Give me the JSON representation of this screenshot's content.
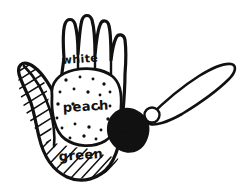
{
  "artwork": {
    "title": "Hand colour-zone sketch with paintbrush",
    "medium": "black ink line drawing",
    "background_color": "#ffffff",
    "ink_color": "#111111"
  },
  "hand": {
    "name": "open hand, palm facing viewer",
    "zones": [
      {
        "id": "fingers",
        "label": "white",
        "fill": "#ffffff",
        "texture": "plain",
        "label_x": 62,
        "label_y": 64,
        "label_size": 11,
        "label_rotation": -4
      },
      {
        "id": "palm",
        "label": "peach",
        "fill": "#ffffff",
        "texture": "dots",
        "label_x": 63,
        "label_y": 112,
        "label_size": 13,
        "label_rotation": -3
      },
      {
        "id": "heel",
        "label": "green",
        "fill": "#ffffff",
        "texture": "diagonal-hatch",
        "label_x": 59,
        "label_y": 161,
        "label_size": 13,
        "label_rotation": -4
      }
    ],
    "thumb": {
      "id": "thumb",
      "texture": "diagonal-hatch"
    },
    "fingers_count": 4
  },
  "brush": {
    "name": "paintbrush",
    "handle_direction": "up-right",
    "bristle_fill": "#111111",
    "ferrule_fill": "#ffffff"
  },
  "palm_dots": [
    [
      66,
      80
    ],
    [
      80,
      77
    ],
    [
      93,
      79
    ],
    [
      104,
      84
    ],
    [
      60,
      92
    ],
    [
      74,
      89
    ],
    [
      88,
      92
    ],
    [
      100,
      95
    ],
    [
      110,
      92
    ],
    [
      58,
      104
    ],
    [
      110,
      106
    ],
    [
      57,
      118
    ],
    [
      108,
      119
    ],
    [
      62,
      128
    ],
    [
      75,
      124
    ],
    [
      89,
      127
    ],
    [
      101,
      130
    ],
    [
      70,
      138
    ],
    [
      84,
      136
    ],
    [
      96,
      139
    ],
    [
      99,
      108
    ],
    [
      73,
      104
    ]
  ]
}
